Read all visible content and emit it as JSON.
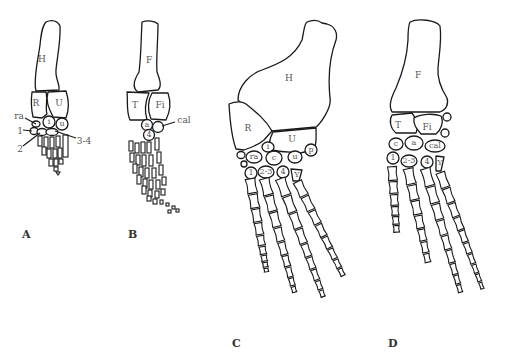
{
  "figure": {
    "panels": [
      {
        "id": "A",
        "label": "A",
        "limb": "forelimb",
        "bones": {
          "H": "H",
          "R": "R",
          "U": "U",
          "i": "i",
          "u": "u"
        },
        "callouts": {
          "ra": "ra",
          "d1": "1",
          "d2": "2",
          "d34": "3-4"
        }
      },
      {
        "id": "B",
        "label": "B",
        "limb": "hindlimb",
        "bones": {
          "F": "F",
          "T": "T",
          "Fi": "Fi",
          "a": "a",
          "d4": "4"
        },
        "callouts": {
          "cal": "cal"
        }
      },
      {
        "id": "C",
        "label": "C",
        "limb": "forelimb",
        "bones": {
          "H": "H",
          "R": "R",
          "U": "U",
          "i": "i",
          "ra": "ra",
          "c": "c",
          "u": "u",
          "p": "p",
          "d1": "1",
          "d23": "2-3",
          "d4": "4",
          "y": "Y"
        }
      },
      {
        "id": "D",
        "label": "D",
        "limb": "hindlimb",
        "bones": {
          "F": "F",
          "T": "T",
          "Fi": "Fi",
          "c": "c",
          "a": "a",
          "cal": "cal",
          "d1": "1",
          "d23": "2-3",
          "d4": "4",
          "y": "Y"
        }
      }
    ]
  }
}
